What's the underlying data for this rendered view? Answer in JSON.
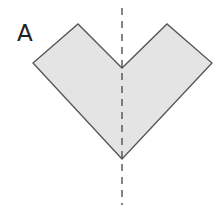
{
  "figure": {
    "label": "A",
    "shape": {
      "name": "v-shape-pentagon",
      "fill": "#e4e4e4",
      "stroke": "#555555",
      "points": [
        [
          33,
          63
        ],
        [
          78,
          24
        ],
        [
          122,
          68
        ],
        [
          167,
          24
        ],
        [
          212,
          63
        ],
        [
          122,
          159
        ]
      ]
    },
    "axis": {
      "name": "line-of-symmetry",
      "style": "dashed",
      "color": "#444444",
      "x": 122,
      "y1": 8,
      "y2": 205
    }
  }
}
